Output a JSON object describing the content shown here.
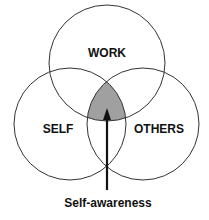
{
  "diagram": {
    "type": "venn",
    "circles": [
      {
        "label": "WORK",
        "cx": 107,
        "cy": 63,
        "r": 58
      },
      {
        "label": "SELF",
        "cx": 70,
        "cy": 124,
        "r": 56
      },
      {
        "label": "OTHERS",
        "cx": 143,
        "cy": 124,
        "r": 56
      }
    ],
    "intersection": {
      "label": "Self-awareness",
      "fill": "#a0a0a0"
    },
    "colors": {
      "stroke": "#333333",
      "text": "#111111",
      "background": "#ffffff"
    }
  }
}
